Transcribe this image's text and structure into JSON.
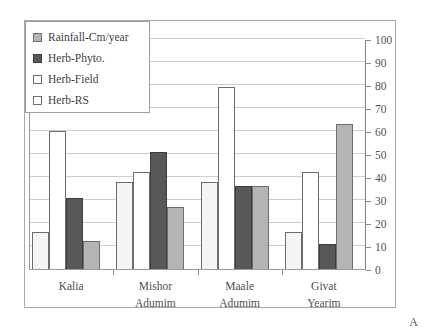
{
  "panel": {
    "letter": "A"
  },
  "legend": {
    "items": [
      {
        "label": "Rainfall-Cm/year",
        "swatch": "s-rain",
        "swatch_name": "legend-swatch-rainfall"
      },
      {
        "label": "Herb-Phyto.",
        "swatch": "s-phyto",
        "swatch_name": "legend-swatch-herb-phyto"
      },
      {
        "label": "Herb-Field",
        "swatch": "s-field",
        "swatch_name": "legend-swatch-herb-field"
      },
      {
        "label": "Herb-RS",
        "swatch": "s-rs",
        "swatch_name": "legend-swatch-herb-rs"
      }
    ]
  },
  "colors": {
    "rainfall": "#b4b4b4",
    "herb_phyto": "#585858",
    "herb_field": "#ffffff",
    "herb_rs": "#f4f4f4",
    "gridline": "#cdcdcd",
    "axis": "#9a9a9a",
    "frame": "#a8a8a8",
    "text": "#4a4a4a"
  },
  "chart_data": {
    "type": "bar",
    "title": "",
    "xlabel": "",
    "ylabel": "",
    "ylim": [
      0,
      100
    ],
    "yticks": [
      100,
      90,
      80,
      70,
      60,
      50,
      40,
      30,
      20,
      10,
      0
    ],
    "grid": true,
    "legend_position": "top-left",
    "axis_side": "right",
    "categories": [
      {
        "line1": "Kalia",
        "line2": ""
      },
      {
        "line1": "Mishor",
        "line2": "Adumim"
      },
      {
        "line1": "Maale",
        "line2": "Adumim"
      },
      {
        "line1": "Givat",
        "line2": "Yearim"
      }
    ],
    "category_labels": [
      "Kalia",
      "Mishor Adumim",
      "Maale Adumim",
      "Givat Yearim"
    ],
    "series": [
      {
        "name": "Rainfall-Cm/year",
        "key": "s-rain",
        "values": [
          16,
          27,
          36,
          63
        ]
      },
      {
        "name": "Herb-Phyto.",
        "key": "s-phyto",
        "values": [
          31,
          51,
          36,
          11
        ]
      },
      {
        "name": "Herb-Field",
        "key": "s-field",
        "values": [
          60,
          42,
          79,
          42
        ]
      },
      {
        "name": "Herb-RS",
        "key": "s-rs",
        "values": [
          16,
          38,
          38,
          16
        ]
      }
    ],
    "bar_order_per_group": [
      "Herb-RS",
      "Herb-Field",
      "Herb-Phyto.",
      "Rainfall-Cm/year"
    ],
    "groups": [
      {
        "category": "Kalia",
        "bars": [
          {
            "series": "Herb-RS",
            "value": 16
          },
          {
            "series": "Herb-Field",
            "value": 60
          },
          {
            "series": "Herb-Phyto.",
            "value": 31
          },
          {
            "series": "Rainfall-Cm/year",
            "value": 12
          }
        ]
      },
      {
        "category": "Mishor Adumim",
        "bars": [
          {
            "series": "Herb-RS",
            "value": 38
          },
          {
            "series": "Herb-Field",
            "value": 42
          },
          {
            "series": "Herb-Phyto.",
            "value": 51
          },
          {
            "series": "Rainfall-Cm/year",
            "value": 27
          }
        ]
      },
      {
        "category": "Maale Adumim",
        "bars": [
          {
            "series": "Herb-RS",
            "value": 38
          },
          {
            "series": "Herb-Field",
            "value": 79
          },
          {
            "series": "Herb-Phyto.",
            "value": 36
          },
          {
            "series": "Rainfall-Cm/year",
            "value": 36
          }
        ]
      },
      {
        "category": "Givat Yearim",
        "bars": [
          {
            "series": "Herb-RS",
            "value": 16
          },
          {
            "series": "Herb-Field",
            "value": 42
          },
          {
            "series": "Herb-Phyto.",
            "value": 11
          },
          {
            "series": "Rainfall-Cm/year",
            "value": 63
          }
        ]
      }
    ]
  }
}
